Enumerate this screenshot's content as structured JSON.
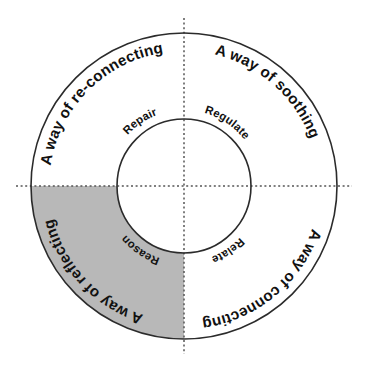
{
  "diagram": {
    "type": "circular-quadrant-wheel",
    "center": {
      "x": 184,
      "y": 186
    },
    "outer_radius": 153,
    "inner_radius": 67,
    "colors": {
      "highlight_fill": "#b8b8b8",
      "plain_fill": "#ffffff",
      "stroke": "#2b2b2b",
      "axis": "#555555",
      "text": "#111111"
    },
    "axes": {
      "horizontal_label": "horizontal-dotted-axis",
      "vertical_label": "vertical-dotted-axis"
    },
    "quadrants": [
      {
        "id": "top-left",
        "outer_label": "A way of re-connecting",
        "inner_label": "Repair",
        "highlighted": false
      },
      {
        "id": "top-right",
        "outer_label": "A way of soothing",
        "inner_label": "Regulate",
        "highlighted": false
      },
      {
        "id": "bottom-right",
        "outer_label": "A way of connecting",
        "inner_label": "Relate",
        "highlighted": false
      },
      {
        "id": "bottom-left",
        "outer_label": "A way of reflecting",
        "inner_label": "Reason",
        "highlighted": true
      }
    ]
  }
}
